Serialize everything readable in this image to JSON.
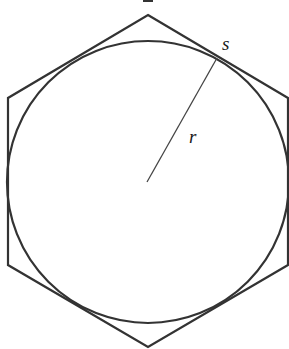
{
  "diagram": {
    "colors": {
      "background": "#ffffff",
      "stroke": "#333333",
      "radius_stroke": "#444444",
      "label": "#1a1a1a"
    },
    "hexagon": {
      "vertices": [
        [
          148,
          15
        ],
        [
          288,
          98
        ],
        [
          288,
          265
        ],
        [
          148,
          347
        ],
        [
          8,
          265
        ],
        [
          8,
          98
        ]
      ]
    },
    "circle": {
      "cx": 148,
      "cy": 182,
      "r": 141
    },
    "radius_line": {
      "x1": 147,
      "y1": 182,
      "x2": 217,
      "y2": 58
    },
    "labels": {
      "side": {
        "text": "s",
        "x": 222,
        "y": 50
      },
      "radius": {
        "text": "r",
        "x": 189,
        "y": 143
      }
    }
  }
}
